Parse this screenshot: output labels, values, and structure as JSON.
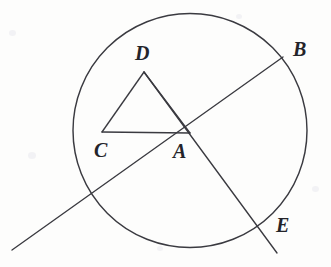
{
  "figure": {
    "canvas": {
      "width": 331,
      "height": 267
    },
    "background_color": "#fdfdfc",
    "stroke_color": "#3a3a40",
    "label_color": "#24242a"
  },
  "circle": {
    "name": "main-circle",
    "center_x": 190,
    "center_y": 130.5,
    "radius": 117
  },
  "points": [
    {
      "id": "D",
      "label": "D",
      "x": 144,
      "y": 72,
      "label_x": 135,
      "label_y": 43,
      "on_circle": false
    },
    {
      "id": "B",
      "label": "B",
      "x": 283,
      "y": 57,
      "label_x": 293,
      "label_y": 39,
      "on_circle": true
    },
    {
      "id": "C",
      "label": "C",
      "x": 102,
      "y": 132,
      "label_x": 94,
      "label_y": 140,
      "on_circle": false
    },
    {
      "id": "A",
      "label": "A",
      "x": 190,
      "y": 133,
      "label_x": 173,
      "label_y": 141,
      "on_circle": false
    },
    {
      "id": "E",
      "label": "E",
      "x": 265,
      "y": 231,
      "label_x": 276,
      "label_y": 215,
      "on_circle": true
    }
  ],
  "segments": [
    {
      "name": "segment-CA",
      "from": "C",
      "to": "A",
      "x1": 102,
      "y1": 132,
      "x2": 190,
      "y2": 133
    },
    {
      "name": "segment-CD",
      "from": "C",
      "to": "D",
      "x1": 102,
      "y1": 132,
      "x2": 144,
      "y2": 72
    },
    {
      "name": "segment-DA",
      "from": "D",
      "to": "A",
      "x1": 144,
      "y1": 72,
      "x2": 190,
      "y2": 133
    }
  ],
  "rays": [
    {
      "name": "ray-B-through-A",
      "description": "secant line entering at B on the circle, passing through A and exiting lower-left beyond the circle",
      "x1": 283,
      "y1": 57,
      "x2": 12,
      "y2": 250
    },
    {
      "name": "ray-D-through-A-to-E",
      "description": "line from D through A, crossing the circle at E and continuing past it",
      "x1": 144,
      "y1": 72,
      "x2": 277,
      "y2": 253
    }
  ]
}
